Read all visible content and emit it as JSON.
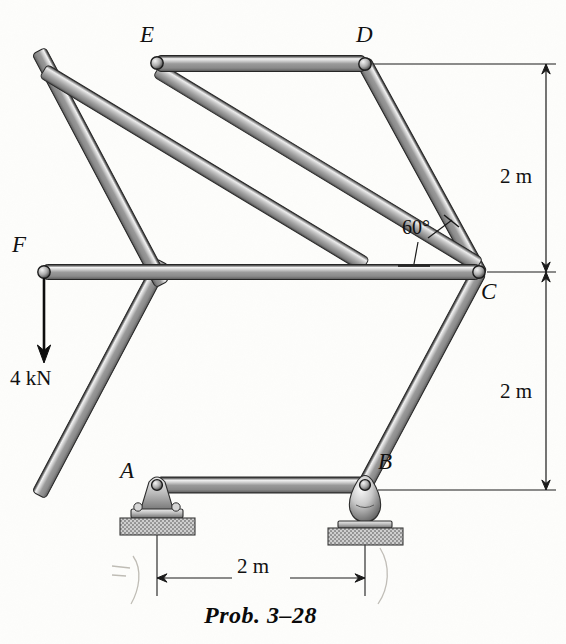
{
  "figure": {
    "type": "statics-truss-diagram",
    "caption": "Prob. 3–28",
    "nodes": [
      {
        "id": "E",
        "label": "E",
        "x": 157,
        "y": 63,
        "label_x": 140,
        "label_y": 28
      },
      {
        "id": "D",
        "label": "D",
        "x": 365,
        "y": 64,
        "label_x": 358,
        "label_y": 28
      },
      {
        "id": "C",
        "label": "C",
        "x": 479,
        "y": 272,
        "label_x": 483,
        "label_y": 283
      },
      {
        "id": "B",
        "label": "B",
        "x": 365,
        "y": 485,
        "label_x": 378,
        "label_y": 455
      },
      {
        "id": "A",
        "label": "A",
        "x": 157,
        "y": 485,
        "label_x": 122,
        "label_y": 462
      },
      {
        "id": "F",
        "label": "F",
        "x": 44,
        "y": 272,
        "label_x": 14,
        "label_y": 238
      }
    ],
    "members": [
      {
        "from": "E",
        "to": "D"
      },
      {
        "from": "D",
        "to": "C"
      },
      {
        "from": "C",
        "to": "B"
      },
      {
        "from": "B",
        "to": "A"
      },
      {
        "from": "A",
        "to": "F"
      },
      {
        "from": "F",
        "to": "E"
      },
      {
        "from": "F",
        "to": "C"
      },
      {
        "from": "F",
        "to": "D"
      },
      {
        "from": "E",
        "to": "C"
      }
    ],
    "load": {
      "label": "4 kN",
      "magnitude": 4,
      "unit": "kN",
      "direction": "down",
      "applied_at": "F",
      "label_x": 10,
      "label_y": 365,
      "arrow_from_y": 278,
      "arrow_to_y": 355
    },
    "angle": {
      "label": "60°",
      "value": 60,
      "at_node": "C",
      "label_x": 404,
      "label_y": 228
    },
    "dimensions": [
      {
        "id": "vert-top",
        "label": "2 m",
        "orientation": "vertical",
        "from_y": 64,
        "to_y": 272,
        "line_x": 546,
        "label_x": 500,
        "label_y": 163
      },
      {
        "id": "vert-bottom",
        "label": "2 m",
        "orientation": "vertical",
        "from_y": 272,
        "to_y": 490,
        "line_x": 546,
        "label_x": 500,
        "label_y": 378
      },
      {
        "id": "horiz-base",
        "label": "2 m",
        "orientation": "horizontal",
        "from_x": 157,
        "to_x": 365,
        "line_y": 578,
        "label_x": 236,
        "label_y": 558
      }
    ],
    "supports": [
      {
        "id": "A",
        "kind": "pin-bracket",
        "x": 157,
        "y": 485
      },
      {
        "id": "B",
        "kind": "rocker-roller",
        "x": 365,
        "y": 485
      }
    ],
    "colors": {
      "member_dark": "#4a4a4a",
      "member_mid": "#8e8e8e",
      "member_light": "#e8e8e8",
      "member_edge": "#2b2b2b",
      "foundation_fill": "#b6b6b6",
      "line": "#1a1a1a",
      "pencil": "#b9b6ae"
    }
  }
}
